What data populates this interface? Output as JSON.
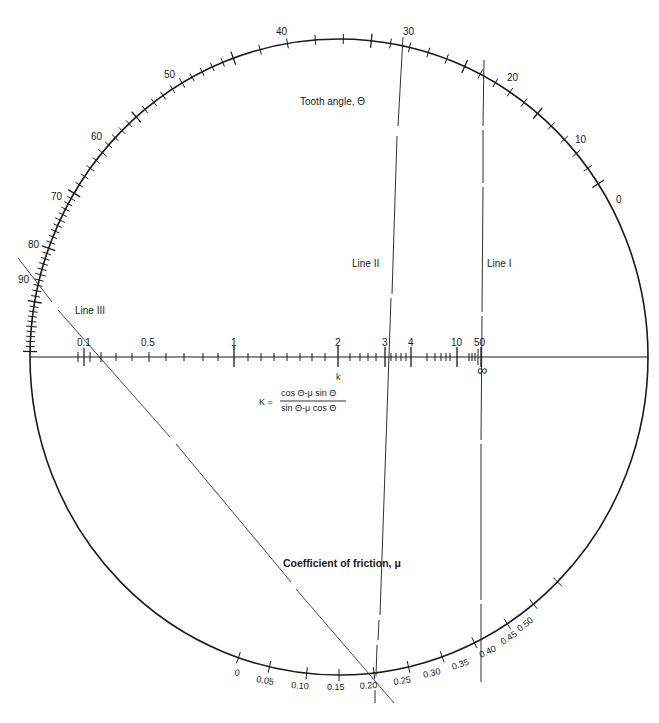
{
  "diagram": {
    "type": "circular nomogram",
    "theta_scale": {
      "title": "Tooth angle, Θ",
      "ticks": [
        "0",
        "10",
        "20",
        "30",
        "40",
        "50",
        "60",
        "70",
        "80",
        "90"
      ]
    },
    "k_scale": {
      "label": "k",
      "ticks": [
        "0.1",
        "0.5",
        "1",
        "2",
        "3",
        "4",
        "10",
        "50"
      ],
      "infinity_label": "∞",
      "formula": {
        "lhs": "K =",
        "numerator": "cos Θ-μ sin Θ",
        "denominator": "sin Θ-μ cos Θ"
      }
    },
    "mu_scale": {
      "title": "Coefficient of friction, μ",
      "ticks": [
        "0",
        "0.05",
        "0.10",
        "0.15",
        "0.20",
        "0.25",
        "0.30",
        "0.35",
        "0.40",
        "0.45",
        "0.50"
      ]
    },
    "lines": [
      {
        "name": "Line I",
        "label": "Line I"
      },
      {
        "name": "Line II",
        "label": "Line II"
      },
      {
        "name": "Line III",
        "label": "Line III"
      }
    ]
  },
  "colors": {
    "ink": "#1a1a1a",
    "background": "#ffffff"
  }
}
